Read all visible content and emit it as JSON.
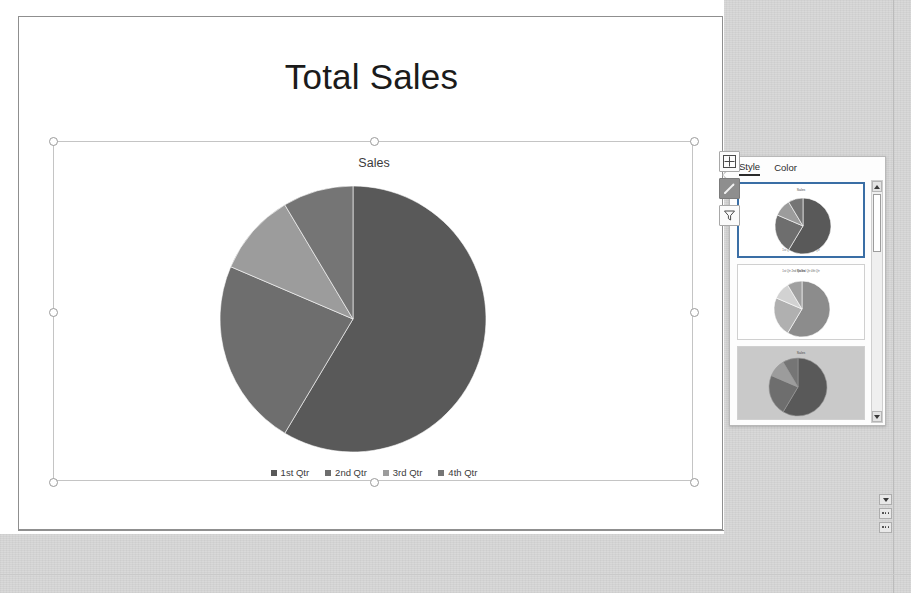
{
  "app": {
    "slide_title": "Total Sales"
  },
  "chart": {
    "title": "Sales",
    "selected": true,
    "side_buttons": [
      {
        "name": "chart-elements-button",
        "icon": "plus-icon",
        "label": "Chart Elements",
        "active": false
      },
      {
        "name": "chart-styles-button",
        "icon": "paintbrush-icon",
        "label": "Chart Styles",
        "active": true
      },
      {
        "name": "chart-filters-button",
        "icon": "funnel-icon",
        "label": "Chart Filters",
        "active": false
      }
    ]
  },
  "chart_data": {
    "type": "pie",
    "title": "Sales",
    "categories": [
      "1st Qtr",
      "2nd Qtr",
      "3rd Qtr",
      "4th Qtr"
    ],
    "values": [
      8.2,
      3.2,
      1.4,
      1.2
    ],
    "percentages": [
      58.6,
      22.9,
      10.0,
      8.6
    ],
    "colors": [
      "#595959",
      "#6e6e6e",
      "#9c9c9c",
      "#757575"
    ],
    "legend_position": "bottom",
    "grid": false,
    "xlabel": "",
    "ylabel": ""
  },
  "style_panel": {
    "tabs": [
      {
        "label": "Style",
        "selected": true
      },
      {
        "label": "Color",
        "selected": false
      }
    ],
    "thumbnails": [
      {
        "name": "chart-style-1",
        "title": "Sales",
        "selected": true,
        "background": "#ffffff",
        "legend": "1st Qtr   2nd Qtr   3rd Qtr   4th Qtr",
        "legend_pos": "bottom"
      },
      {
        "name": "chart-style-2",
        "title": "Sales",
        "selected": false,
        "background": "#ffffff",
        "legend": "1st Qtr   2nd Qtr   3rd Qtr   4th Qtr",
        "legend_pos": "top"
      },
      {
        "name": "chart-style-3",
        "title": "Sales",
        "selected": false,
        "background": "#c9c9c9",
        "legend": "",
        "legend_pos": "right"
      }
    ],
    "scrollbar": {
      "up_arrow": "scroll-up-icon",
      "down_arrow": "scroll-down-icon"
    }
  },
  "side_nav": {
    "buttons": [
      {
        "name": "previous-slide-button",
        "icon": "scroll-down-icon"
      },
      {
        "name": "slide-sorter-button",
        "icon": "ellipsis-icon"
      },
      {
        "name": "next-slide-button",
        "icon": "ellipsis-icon"
      }
    ]
  }
}
